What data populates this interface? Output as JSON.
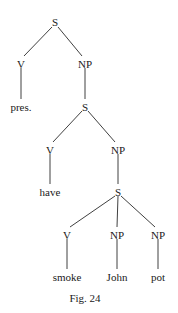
{
  "diagram": {
    "type": "syntax-tree",
    "caption": "Fig. 24",
    "nodes": [
      {
        "id": "n0",
        "label": "S",
        "x": 55,
        "y": 22
      },
      {
        "id": "n1",
        "label": "V",
        "x": 21,
        "y": 64
      },
      {
        "id": "n2",
        "label": "NP",
        "x": 85,
        "y": 64
      },
      {
        "id": "n3",
        "label": "pres.",
        "x": 21,
        "y": 107
      },
      {
        "id": "n4",
        "label": "S",
        "x": 85,
        "y": 107
      },
      {
        "id": "n5",
        "label": "V",
        "x": 50,
        "y": 150
      },
      {
        "id": "n6",
        "label": "NP",
        "x": 118,
        "y": 150
      },
      {
        "id": "n7",
        "label": "have",
        "x": 50,
        "y": 192
      },
      {
        "id": "n8",
        "label": "S",
        "x": 118,
        "y": 192
      },
      {
        "id": "n9",
        "label": "V",
        "x": 67,
        "y": 235
      },
      {
        "id": "n10",
        "label": "NP",
        "x": 117,
        "y": 235
      },
      {
        "id": "n11",
        "label": "NP",
        "x": 158,
        "y": 235
      },
      {
        "id": "n12",
        "label": "smoke",
        "x": 67,
        "y": 277
      },
      {
        "id": "n13",
        "label": "John",
        "x": 117,
        "y": 277
      },
      {
        "id": "n14",
        "label": "pot",
        "x": 158,
        "y": 277
      }
    ],
    "edges": [
      [
        "n0",
        "n1"
      ],
      [
        "n0",
        "n2"
      ],
      [
        "n1",
        "n3"
      ],
      [
        "n2",
        "n4"
      ],
      [
        "n4",
        "n5"
      ],
      [
        "n4",
        "n6"
      ],
      [
        "n5",
        "n7"
      ],
      [
        "n6",
        "n8"
      ],
      [
        "n8",
        "n9"
      ],
      [
        "n8",
        "n10"
      ],
      [
        "n8",
        "n11"
      ],
      [
        "n9",
        "n12"
      ],
      [
        "n10",
        "n13"
      ],
      [
        "n11",
        "n14"
      ]
    ]
  }
}
